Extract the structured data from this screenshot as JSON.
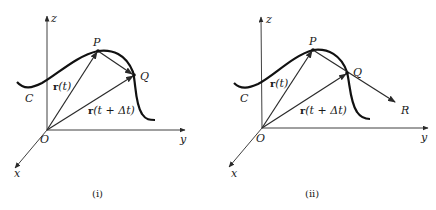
{
  "figures": [
    {
      "id": "i",
      "caption": "(i)",
      "axes": {
        "z": "z",
        "y": "y",
        "x": "x",
        "origin": "O"
      },
      "curve_label": "C",
      "points": {
        "P": "P",
        "Q": "Q"
      },
      "vectors": [
        {
          "from": "O",
          "to": "P",
          "label": "r(t)"
        },
        {
          "from": "O",
          "to": "Q",
          "label": "r(t + Δt)"
        },
        {
          "from": "P",
          "to": "Q",
          "label": ""
        }
      ]
    },
    {
      "id": "ii",
      "caption": "(ii)",
      "axes": {
        "z": "z",
        "y": "y",
        "x": "x",
        "origin": "O"
      },
      "curve_label": "C",
      "points": {
        "P": "P",
        "Q": "Q",
        "R": "R"
      },
      "vectors": [
        {
          "from": "O",
          "to": "P",
          "label": "r(t)"
        },
        {
          "from": "O",
          "to": "Q",
          "label": "r(t + Δt)"
        },
        {
          "from": "P",
          "to": "R",
          "label": ""
        }
      ]
    }
  ],
  "labels": {
    "f1": {
      "z": "z",
      "y": "y",
      "x": "x",
      "O": "O",
      "C": "C",
      "P": "P",
      "Q": "Q",
      "r_t_bold": "r",
      "r_t_rest": "(t)",
      "r_dt_bold": "r",
      "r_dt_rest": "(t + Δt)",
      "caption": "(i)"
    },
    "f2": {
      "z": "z",
      "y": "y",
      "x": "x",
      "O": "O",
      "C": "C",
      "P": "P",
      "Q": "Q",
      "R": "R",
      "r_t_bold": "r",
      "r_t_rest": "(t)",
      "r_dt_bold": "r",
      "r_dt_rest": "(t + Δt)",
      "caption": "(ii)"
    }
  },
  "colors": {
    "ink": "#1a1a1a",
    "background": "#ffffff"
  }
}
